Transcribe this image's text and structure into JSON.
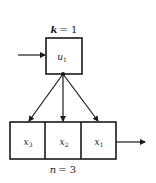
{
  "diagram": {
    "top_label": {
      "var": "k",
      "eq": "= 1"
    },
    "top_box": {
      "var": "u",
      "sub": "1"
    },
    "bottom_cells": [
      {
        "var": "x",
        "sub": "3"
      },
      {
        "var": "x",
        "sub": "2"
      },
      {
        "var": "x",
        "sub": "1"
      }
    ],
    "bottom_label": {
      "var": "n",
      "eq": "= 3"
    },
    "colors": {
      "stroke": "#1a1a1a",
      "background": "#ffffff"
    }
  }
}
